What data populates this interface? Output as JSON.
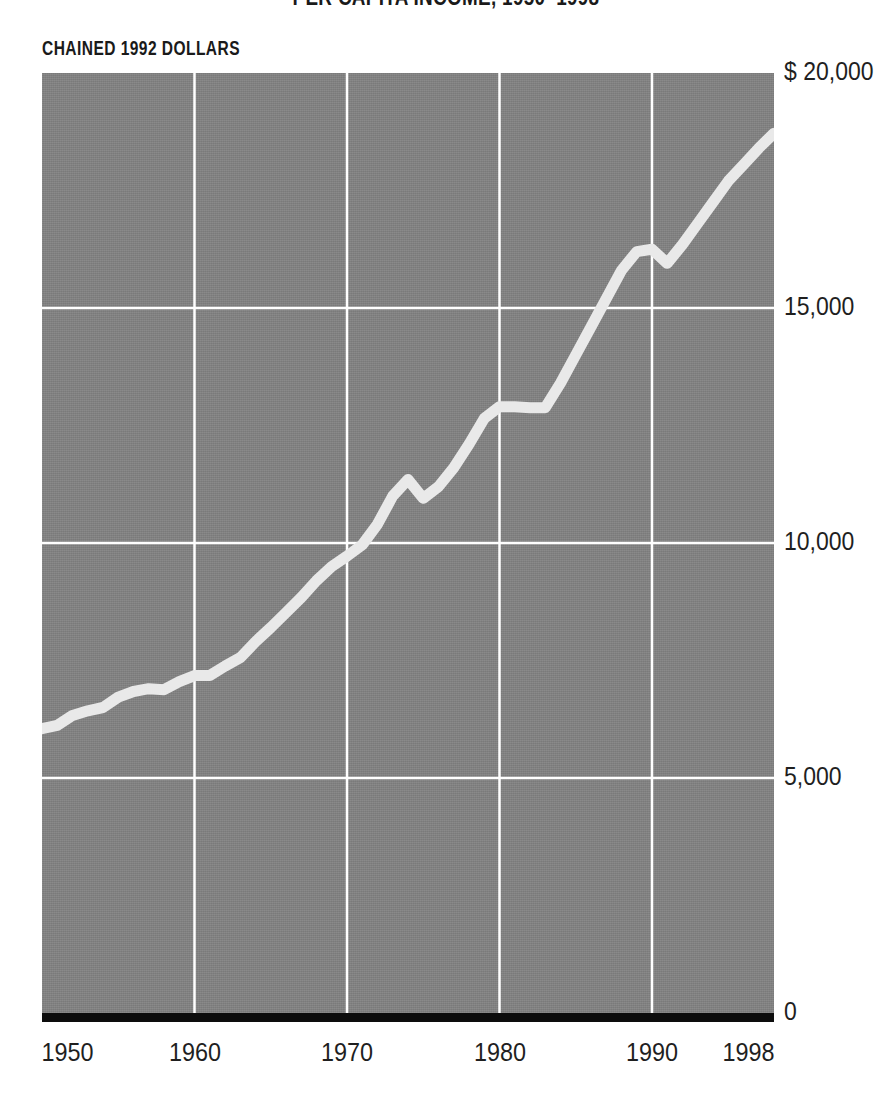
{
  "header": {
    "title_clipped": "PER CAPITA INCOME, 1950–1998",
    "units_label": "CHAINED 1992 DOLLARS"
  },
  "colors": {
    "plot_background": "#818181",
    "gridline": "#ffffff",
    "data_line": "#e9e9e9",
    "baseline": "#0d0d0d",
    "text": "#1f1f1f",
    "page_background": "#ffffff"
  },
  "axis": {
    "y_ticks": [
      {
        "label": "$ 20,000",
        "value": 20000
      },
      {
        "label": "15,000",
        "value": 15000
      },
      {
        "label": "10,000",
        "value": 10000
      },
      {
        "label": "5,000",
        "value": 5000
      },
      {
        "label": "0",
        "value": 0
      }
    ],
    "x_ticks": [
      {
        "label": "1950",
        "value": 1950
      },
      {
        "label": "1960",
        "value": 1960
      },
      {
        "label": "1970",
        "value": 1970
      },
      {
        "label": "1980",
        "value": 1980
      },
      {
        "label": "1990",
        "value": 1990
      },
      {
        "label": "1998",
        "value": 1998
      }
    ]
  },
  "chart_data": {
    "type": "line",
    "title": "PER CAPITA INCOME, 1950–1998",
    "subtitle": "CHAINED 1992 DOLLARS",
    "xlabel": "",
    "ylabel": "CHAINED 1992 DOLLARS",
    "xlim": [
      1950,
      1998
    ],
    "ylim": [
      0,
      20000
    ],
    "grid": true,
    "legend": "none",
    "y_tick_labels": [
      "$ 20,000",
      "15,000",
      "10,000",
      "5,000",
      "0"
    ],
    "y_tick_values": [
      20000,
      15000,
      10000,
      5000,
      0
    ],
    "x_tick_labels": [
      "1950",
      "1960",
      "1970",
      "1980",
      "1990",
      "1998"
    ],
    "x_tick_values": [
      1950,
      1960,
      1970,
      1980,
      1990,
      1998
    ],
    "series": [
      {
        "name": "Per capita income (chained 1992 dollars)",
        "x": [
          1950,
          1951,
          1952,
          1953,
          1954,
          1955,
          1956,
          1957,
          1958,
          1959,
          1960,
          1961,
          1962,
          1963,
          1964,
          1965,
          1966,
          1967,
          1968,
          1969,
          1970,
          1971,
          1972,
          1973,
          1974,
          1975,
          1976,
          1977,
          1978,
          1979,
          1980,
          1981,
          1982,
          1983,
          1984,
          1985,
          1986,
          1987,
          1988,
          1989,
          1990,
          1991,
          1992,
          1993,
          1994,
          1995,
          1996,
          1997,
          1998
        ],
        "values": [
          6050,
          6120,
          6330,
          6430,
          6500,
          6720,
          6840,
          6900,
          6880,
          7050,
          7180,
          7180,
          7380,
          7560,
          7900,
          8200,
          8520,
          8840,
          9200,
          9500,
          9720,
          9960,
          10400,
          11000,
          11350,
          10950,
          11200,
          11600,
          12100,
          12650,
          12900,
          12900,
          12880,
          12880,
          13400,
          14000,
          14600,
          15200,
          15800,
          16200,
          16250,
          15950,
          16350,
          16800,
          17250,
          17700,
          18050,
          18400,
          18720
        ]
      }
    ]
  }
}
